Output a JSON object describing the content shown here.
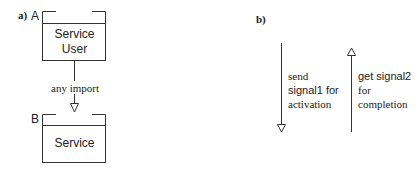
{
  "panel_a": {
    "label": "a)",
    "box_a": {
      "letter": "A",
      "line1": "Service",
      "line2": "User"
    },
    "box_b": {
      "letter": "B",
      "line1": "Service"
    },
    "connector_label": "any import"
  },
  "panel_b": {
    "label": "b)",
    "down_arrow": {
      "line1": "send",
      "line2": "signal1 for",
      "line3": "activation"
    },
    "up_arrow": {
      "line1": "get signal2",
      "line2": "for",
      "line3": "completion"
    }
  },
  "colors": {
    "line": "#333333",
    "text": "#222222",
    "background": "#ffffff"
  }
}
